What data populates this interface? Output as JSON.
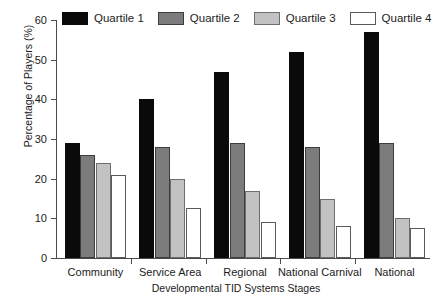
{
  "chart_data": {
    "type": "bar",
    "title": "",
    "xlabel": "Developmental TID Systems Stages",
    "ylabel": "Percentage of Players (%)",
    "categories": [
      "Community",
      "Service Area",
      "Regional",
      "National Carnival",
      "National"
    ],
    "ylim": [
      0,
      60
    ],
    "yticks": [
      0,
      10,
      20,
      30,
      40,
      50,
      60
    ],
    "ytick_labels": [
      "0",
      "10",
      "20",
      "30",
      "40",
      "50",
      "60"
    ],
    "grid": false,
    "legend_position": "top",
    "series": [
      {
        "name": "Quartile 1",
        "color": "#0a0a0a",
        "values": [
          29,
          40,
          47,
          52,
          57
        ]
      },
      {
        "name": "Quartile 2",
        "color": "#7c7c7c",
        "values": [
          26,
          28,
          29,
          28,
          29
        ]
      },
      {
        "name": "Quartile 3",
        "color": "#c2c2c2",
        "values": [
          24,
          20,
          17,
          15,
          10
        ]
      },
      {
        "name": "Quartile 4",
        "color": "#ffffff",
        "values": [
          21,
          12.5,
          9,
          8,
          7.5
        ]
      }
    ]
  },
  "legend": {
    "items": [
      {
        "label": "Quartile 1"
      },
      {
        "label": "Quartile 2"
      },
      {
        "label": "Quartile 3"
      },
      {
        "label": "Quartile 4"
      }
    ]
  }
}
